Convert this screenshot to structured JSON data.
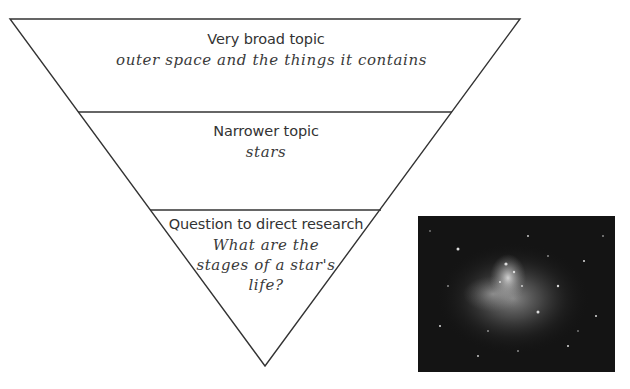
{
  "funnel": {
    "levels": [
      {
        "heading": "Very broad topic",
        "example": "outer space and the things it contains"
      },
      {
        "heading": "Narrower topic",
        "example": "stars"
      },
      {
        "heading": "Question to direct research",
        "example_lines": [
          "What are the",
          "stages of a star's",
          "life?"
        ]
      }
    ],
    "stroke_color": "#333333"
  },
  "photo": {
    "subject": "nebula-star-field-image",
    "tone": "grayscale"
  }
}
